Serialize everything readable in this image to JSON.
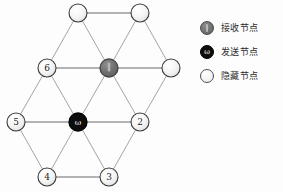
{
  "figure": {
    "type": "network-diagram"
  },
  "legend": {
    "items": [
      {
        "marker": "gray-filled-circle-icon",
        "label": "接收节点",
        "color": "#6e6e6e",
        "glyph": ""
      },
      {
        "marker": "black-filled-circle-icon",
        "label": "发送节点",
        "color": "#0d0d0d",
        "glyph": "ω"
      },
      {
        "marker": "white-circle-icon",
        "label": "隐藏节点",
        "color": "#f4f4f4",
        "glyph": ""
      }
    ]
  },
  "graph": {
    "colors": {
      "edge": "#9a9a9a",
      "edge_dark": "#6a6a6a",
      "node_stroke": "#3c3c3c",
      "hidden_fill": "#f2f2f2",
      "receive_fill": "#6e6e6e",
      "send_fill": "#0d0d0d",
      "label_text": "#1d1d1d"
    },
    "nodes": [
      {
        "id": "t1",
        "label": "",
        "kind": "hidden",
        "x": 78,
        "y": 13,
        "r": 9
      },
      {
        "id": "t2",
        "label": "",
        "kind": "hidden",
        "x": 140,
        "y": 13,
        "r": 9
      },
      {
        "id": "n6",
        "label": "6",
        "kind": "hidden",
        "x": 47,
        "y": 68,
        "r": 9
      },
      {
        "id": "rx",
        "label": "",
        "kind": "receive",
        "x": 109,
        "y": 68,
        "r": 9
      },
      {
        "id": "r1",
        "label": "",
        "kind": "hidden",
        "x": 171,
        "y": 68,
        "r": 9
      },
      {
        "id": "n5",
        "label": "5",
        "kind": "hidden",
        "x": 16,
        "y": 122,
        "r": 9
      },
      {
        "id": "tx",
        "label": "ω",
        "kind": "send",
        "x": 78,
        "y": 122,
        "r": 9
      },
      {
        "id": "n2",
        "label": "2",
        "kind": "hidden",
        "x": 140,
        "y": 122,
        "r": 9
      },
      {
        "id": "n4",
        "label": "4",
        "kind": "hidden",
        "x": 47,
        "y": 177,
        "r": 9
      },
      {
        "id": "n3",
        "label": "3",
        "kind": "hidden",
        "x": 109,
        "y": 177,
        "r": 9
      }
    ],
    "edges": [
      {
        "from": "t1",
        "to": "t2"
      },
      {
        "from": "t1",
        "to": "n6"
      },
      {
        "from": "t1",
        "to": "rx"
      },
      {
        "from": "t2",
        "to": "rx"
      },
      {
        "from": "t2",
        "to": "r1"
      },
      {
        "from": "n6",
        "to": "rx"
      },
      {
        "from": "rx",
        "to": "r1"
      },
      {
        "from": "n6",
        "to": "n5"
      },
      {
        "from": "n6",
        "to": "tx"
      },
      {
        "from": "rx",
        "to": "tx"
      },
      {
        "from": "rx",
        "to": "n2"
      },
      {
        "from": "r1",
        "to": "n2"
      },
      {
        "from": "n5",
        "to": "tx"
      },
      {
        "from": "tx",
        "to": "n2"
      },
      {
        "from": "n5",
        "to": "n4"
      },
      {
        "from": "tx",
        "to": "n4"
      },
      {
        "from": "tx",
        "to": "n3"
      },
      {
        "from": "n2",
        "to": "n3"
      },
      {
        "from": "n4",
        "to": "n3"
      }
    ]
  }
}
